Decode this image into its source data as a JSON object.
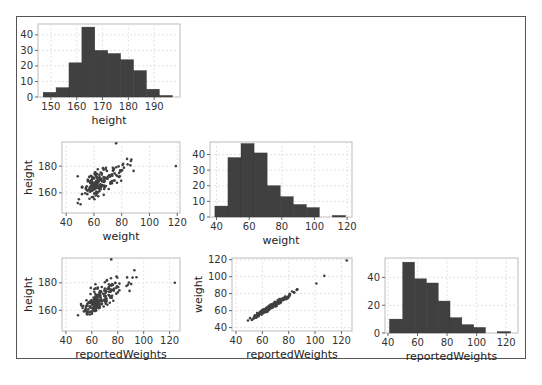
{
  "chart_data": [
    {
      "id": "height-hist",
      "type": "bar",
      "title": "",
      "xlabel": "height",
      "ylabel": "",
      "bins": [
        [
          147,
          152
        ],
        [
          152,
          157
        ],
        [
          157,
          162
        ],
        [
          162,
          167
        ],
        [
          167,
          172
        ],
        [
          172,
          177
        ],
        [
          177,
          182
        ],
        [
          182,
          187
        ],
        [
          187,
          192
        ],
        [
          192,
          197
        ]
      ],
      "values": [
        3,
        6,
        22,
        45,
        30,
        28,
        24,
        17,
        5,
        1
      ],
      "xticks": [
        150,
        160,
        170,
        180,
        190
      ],
      "yticks": [
        0,
        10,
        20,
        30,
        40
      ],
      "xlim": [
        145,
        200
      ],
      "ylim": [
        0,
        47
      ],
      "grid": true
    },
    {
      "id": "weight-vs-height-scatter",
      "type": "scatter",
      "xlabel": "weight",
      "ylabel": "height",
      "xticks": [
        40,
        60,
        80,
        100,
        120
      ],
      "yticks": [
        160,
        180
      ],
      "xlim": [
        37,
        122
      ],
      "ylim": [
        145,
        198
      ],
      "grid": true
    },
    {
      "id": "weight-hist",
      "type": "bar",
      "xlabel": "weight",
      "ylabel": "",
      "bins": [
        [
          39,
          47
        ],
        [
          47,
          55
        ],
        [
          55,
          63
        ],
        [
          63,
          71
        ],
        [
          71,
          79
        ],
        [
          79,
          87
        ],
        [
          87,
          95
        ],
        [
          95,
          103
        ],
        [
          103,
          111
        ],
        [
          111,
          119
        ]
      ],
      "values": [
        7,
        38,
        47,
        41,
        20,
        13,
        8,
        6,
        0,
        1
      ],
      "xticks": [
        40,
        60,
        80,
        100,
        120
      ],
      "yticks": [
        0,
        10,
        20,
        30,
        40
      ],
      "xlim": [
        36,
        123
      ],
      "ylim": [
        0,
        48
      ],
      "grid": true
    },
    {
      "id": "reportedWeights-vs-height-scatter",
      "type": "scatter",
      "xlabel": "reportedWeights",
      "ylabel": "height",
      "xticks": [
        40,
        60,
        80,
        100,
        120
      ],
      "yticks": [
        160,
        180
      ],
      "xlim": [
        37,
        128
      ],
      "ylim": [
        145,
        198
      ],
      "grid": true
    },
    {
      "id": "reportedWeights-vs-weight-scatter",
      "type": "scatter",
      "xlabel": "reportedWeights",
      "ylabel": "weight",
      "xticks": [
        40,
        60,
        80,
        100,
        120
      ],
      "yticks": [
        40,
        60,
        80,
        100,
        120
      ],
      "xlim": [
        37,
        128
      ],
      "ylim": [
        36,
        122
      ],
      "grid": true
    },
    {
      "id": "reportedWeights-hist",
      "type": "bar",
      "xlabel": "reportedWeights",
      "ylabel": "",
      "bins": [
        [
          41,
          50
        ],
        [
          50,
          58
        ],
        [
          58,
          66
        ],
        [
          66,
          74
        ],
        [
          74,
          82
        ],
        [
          82,
          90
        ],
        [
          90,
          98
        ],
        [
          98,
          106
        ],
        [
          106,
          114
        ],
        [
          114,
          123
        ]
      ],
      "values": [
        10,
        51,
        39,
        36,
        23,
        11,
        6,
        4,
        0,
        1
      ],
      "xticks": [
        40,
        60,
        80,
        100,
        120
      ],
      "yticks": [
        0,
        20,
        40
      ],
      "xlim": [
        38,
        128
      ],
      "ylim": [
        0,
        54
      ],
      "grid": true
    }
  ],
  "labels": {
    "height": "height",
    "weight": "weight",
    "reportedWeights": "reportedWeights"
  },
  "colors": {
    "bar": "#404040",
    "point": "#404040",
    "grid": "#e4e4e4",
    "spine": "#bbbbbb",
    "frame": "#555555"
  }
}
